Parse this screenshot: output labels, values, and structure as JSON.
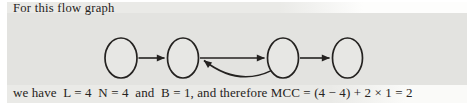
{
  "page": {
    "intro_text": "For this flow graph",
    "result_text": "we have  L = 4  N = 4  and  B = 1, and therefore MCC = (4 − 4) + 2 × 1 = 2"
  },
  "metrics": {
    "L": 4,
    "N": 4,
    "B": 1,
    "MCC": 2
  },
  "colors": {
    "paper": "#eaeae7",
    "figure_band": "#e3e3e0",
    "ink": "#262321",
    "edge_stroke": "#242220",
    "node_fill": "#e7e7e4"
  },
  "diagram": {
    "type": "flow-graph",
    "nodes": [
      {
        "id": "n1",
        "cx": 121,
        "cy": 58,
        "rx": 16,
        "ry": 20
      },
      {
        "id": "n2",
        "cx": 183,
        "cy": 58,
        "rx": 15.5,
        "ry": 20
      },
      {
        "id": "n3",
        "cx": 283,
        "cy": 58,
        "rx": 15.5,
        "ry": 20
      },
      {
        "id": "n4",
        "cx": 347.5,
        "cy": 58,
        "rx": 15,
        "ry": 20
      }
    ],
    "edges": [
      {
        "from": "n1",
        "to": "n2",
        "style": "straight"
      },
      {
        "from": "n2",
        "to": "n3",
        "style": "straight"
      },
      {
        "from": "n3",
        "to": "n2",
        "style": "curved-below"
      },
      {
        "from": "n3",
        "to": "n4",
        "style": "straight"
      }
    ]
  }
}
